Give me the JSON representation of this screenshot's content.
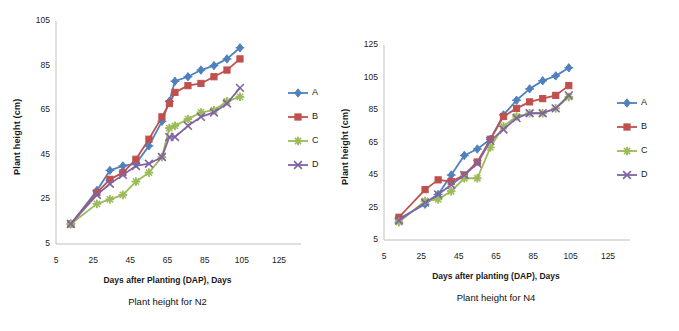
{
  "figure": {
    "colors": {
      "series_a": "#4f81bd",
      "series_b": "#c0504d",
      "series_c": "#9bbb59",
      "series_d": "#8064a2",
      "axis": "#bfbfbf",
      "text": "#1a1a1a"
    }
  },
  "chart_data": [
    {
      "type": "line",
      "id": "n2",
      "title": "Plant height for N2",
      "xlabel": "Days after Planting (DAP), Days",
      "ylabel": "Plant height (cm)",
      "xlim": [
        5,
        125
      ],
      "ylim": [
        5,
        105
      ],
      "xticks": [
        5,
        25,
        45,
        65,
        85,
        105,
        125
      ],
      "yticks": [
        5,
        25,
        45,
        65,
        85,
        105
      ],
      "grid": false,
      "legend_position": "right",
      "x": [
        13,
        27,
        34,
        41,
        48,
        55,
        62,
        66,
        69,
        76,
        83,
        90,
        97,
        104
      ],
      "series": [
        {
          "name": "A",
          "color": "#4f81bd",
          "marker": "diamond",
          "values": [
            14,
            29,
            38,
            40,
            41,
            49,
            60,
            69,
            78,
            80,
            83,
            85,
            88,
            93
          ]
        },
        {
          "name": "B",
          "color": "#c0504d",
          "marker": "square",
          "values": [
            14,
            28,
            34,
            37,
            43,
            52,
            62,
            68,
            73,
            76,
            77,
            80,
            83,
            88
          ]
        },
        {
          "name": "C",
          "color": "#9bbb59",
          "marker": "star",
          "values": [
            14,
            23,
            25,
            27,
            33,
            37,
            44,
            57,
            58,
            61,
            64,
            65,
            69,
            71
          ]
        },
        {
          "name": "D",
          "color": "#8064a2",
          "marker": "cross",
          "values": [
            14,
            27,
            32,
            36,
            40,
            41,
            44,
            53,
            53,
            58,
            62,
            64,
            68,
            75
          ]
        }
      ]
    },
    {
      "type": "line",
      "id": "n4",
      "title": "Plant height for N4",
      "xlabel": "Days after planting (DAP), Days",
      "ylabel": "Plant height (cm)",
      "xlim": [
        5,
        125
      ],
      "ylim": [
        5,
        125
      ],
      "xticks": [
        5,
        25,
        45,
        65,
        85,
        105,
        125
      ],
      "yticks": [
        5,
        25,
        45,
        65,
        85,
        105,
        125
      ],
      "grid": false,
      "legend_position": "right",
      "x": [
        13,
        27,
        34,
        41,
        48,
        55,
        62,
        69,
        76,
        83,
        90,
        97,
        104
      ],
      "series": [
        {
          "name": "A",
          "color": "#4f81bd",
          "marker": "diamond",
          "values": [
            18,
            27,
            33,
            45,
            57,
            61,
            67,
            82,
            91,
            98,
            103,
            106,
            111
          ]
        },
        {
          "name": "B",
          "color": "#c0504d",
          "marker": "square",
          "values": [
            19,
            36,
            42,
            41,
            45,
            53,
            67,
            81,
            86,
            90,
            92,
            94,
            100
          ]
        },
        {
          "name": "C",
          "color": "#9bbb59",
          "marker": "star",
          "values": [
            16,
            29,
            30,
            35,
            43,
            43,
            62,
            75,
            81,
            83,
            83,
            86,
            93
          ]
        },
        {
          "name": "D",
          "color": "#8064a2",
          "marker": "cross",
          "values": [
            17,
            28,
            33,
            39,
            45,
            52,
            66,
            73,
            80,
            83,
            83,
            86,
            94
          ]
        }
      ]
    }
  ],
  "legend": {
    "entries": [
      {
        "label": "A",
        "color": "#4f81bd"
      },
      {
        "label": "B",
        "color": "#c0504d"
      },
      {
        "label": "C",
        "color": "#9bbb59"
      },
      {
        "label": "D",
        "color": "#8064a2"
      }
    ]
  }
}
